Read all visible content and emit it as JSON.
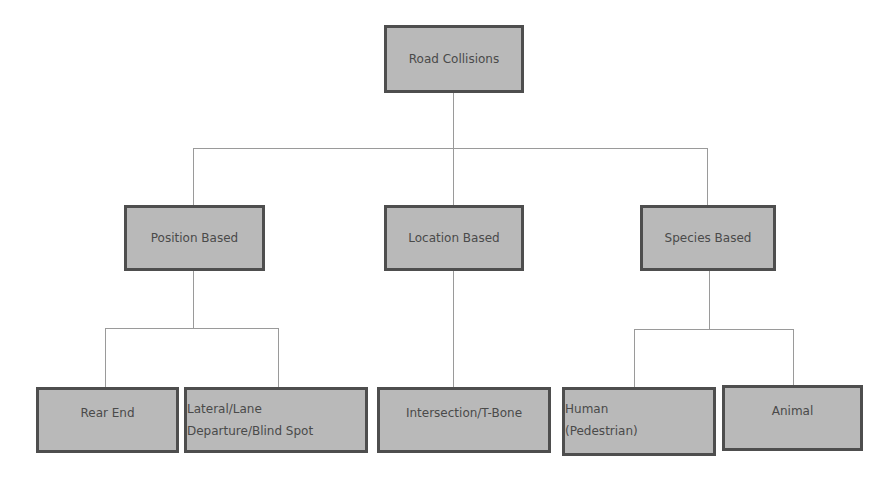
{
  "diagram": {
    "type": "hierarchy-tree",
    "colors": {
      "node_fill": "#b9b9b9",
      "node_border": "#4e4e4e",
      "text": "#4a4a4a",
      "connector": "#9a9a9a"
    },
    "root": {
      "label": "Road Collisions"
    },
    "categories": [
      {
        "label": "Position Based",
        "children": [
          {
            "label_lines": [
              "Rear End"
            ]
          },
          {
            "label_lines": [
              "Lateral/Lane",
              "Departure/Blind Spot"
            ]
          }
        ]
      },
      {
        "label": "Location Based",
        "children": [
          {
            "label_lines": [
              "Intersection/T-Bone"
            ]
          }
        ]
      },
      {
        "label": "Species Based",
        "children": [
          {
            "label_lines": [
              "Human",
              "(Pedestrian)"
            ]
          },
          {
            "label_lines": [
              "Animal"
            ]
          }
        ]
      }
    ]
  }
}
